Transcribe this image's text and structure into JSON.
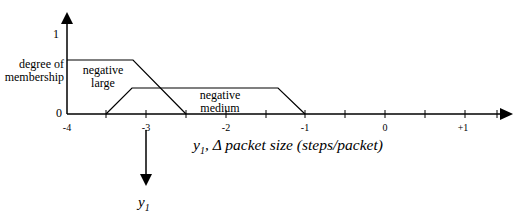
{
  "diagram": {
    "title": "",
    "y_axis": {
      "label_line1": "degree of",
      "label_line2": "membership",
      "tick_top": "1",
      "tick_bottom": "0"
    },
    "x_axis": {
      "label_var": "y",
      "label_sub": "1",
      "label_rest": ", Δ packet size (steps/packet)",
      "ticks": [
        "-4",
        "-3",
        "-2",
        "-1",
        "0",
        "+1"
      ]
    },
    "sets": [
      {
        "name_line1": "negative",
        "name_line2": "large",
        "points": [
          [
            -4,
            1
          ],
          [
            -3.4,
            1
          ],
          [
            -2.5,
            0
          ]
        ]
      },
      {
        "name_line1": "negative",
        "name_line2": "medium",
        "points": [
          [
            -3.5,
            0
          ],
          [
            -3.2,
            0.8
          ],
          [
            -1.3,
            0.8
          ],
          [
            -1,
            0
          ]
        ]
      }
    ],
    "output_arrow": {
      "var": "y",
      "sub": "1"
    },
    "colors": {
      "line": "#000000",
      "background": "#ffffff"
    }
  }
}
